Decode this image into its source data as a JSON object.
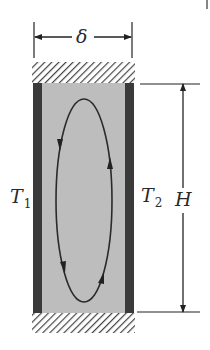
{
  "diagram": {
    "colors": {
      "wall": "#3a3a3a",
      "fluid": "#bdbdbd",
      "hatch": "#444444",
      "line": "#222222",
      "background": "#ffffff"
    },
    "labels": {
      "width": "δ",
      "left_wall_temp": "T",
      "left_wall_temp_sub": "1",
      "right_wall_temp": "T",
      "right_wall_temp_sub": "2",
      "height": "H"
    }
  }
}
